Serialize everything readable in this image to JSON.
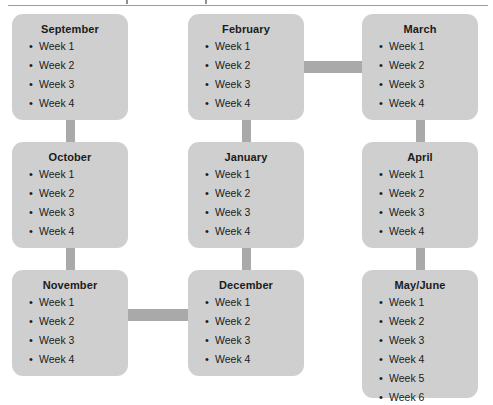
{
  "document": {
    "title_fragment_visible": "",
    "top_rule": true
  },
  "diagram": {
    "type": "month-week-flow",
    "colors": {
      "box_fill": "#cfcfcf",
      "connector": "#a9a9a9",
      "text": "#1b1b1b",
      "rule": "#9b9b9b",
      "background": "#ffffff"
    },
    "boxes": [
      {
        "id": "september",
        "title": "September",
        "weeks": [
          "Week 1",
          "Week 2",
          "Week 3",
          "Week 4"
        ],
        "x": 12,
        "y": 14,
        "w": 116,
        "h": 106
      },
      {
        "id": "february",
        "title": "February",
        "weeks": [
          "Week 1",
          "Week 2",
          "Week 3",
          "Week 4"
        ],
        "x": 188,
        "y": 14,
        "w": 116,
        "h": 106
      },
      {
        "id": "march",
        "title": "March",
        "weeks": [
          "Week 1",
          "Week 2",
          "Week 3",
          "Week 4"
        ],
        "x": 362,
        "y": 14,
        "w": 116,
        "h": 106
      },
      {
        "id": "october",
        "title": "October",
        "weeks": [
          "Week 1",
          "Week 2",
          "Week 3",
          "Week 4"
        ],
        "x": 12,
        "y": 142,
        "w": 116,
        "h": 106
      },
      {
        "id": "january",
        "title": "January",
        "weeks": [
          "Week 1",
          "Week 2",
          "Week 3",
          "Week 4"
        ],
        "x": 188,
        "y": 142,
        "w": 116,
        "h": 106
      },
      {
        "id": "april",
        "title": "April",
        "weeks": [
          "Week 1",
          "Week 2",
          "Week 3",
          "Week 4"
        ],
        "x": 362,
        "y": 142,
        "w": 116,
        "h": 106
      },
      {
        "id": "november",
        "title": "November",
        "weeks": [
          "Week 1",
          "Week 2",
          "Week 3",
          "Week 4"
        ],
        "x": 12,
        "y": 270,
        "w": 116,
        "h": 106
      },
      {
        "id": "december",
        "title": "December",
        "weeks": [
          "Week 1",
          "Week 2",
          "Week 3",
          "Week 4"
        ],
        "x": 188,
        "y": 270,
        "w": 116,
        "h": 106
      },
      {
        "id": "may-june",
        "title": "May/June",
        "weeks": [
          "Week 1",
          "Week 2",
          "Week 3",
          "Week 4",
          "Week 5",
          "Week 6"
        ],
        "x": 362,
        "y": 270,
        "w": 116,
        "h": 128
      }
    ],
    "connectors": [
      {
        "id": "february-to-march",
        "orientation": "h",
        "x": 304,
        "y": 61,
        "w": 58,
        "h": 12
      },
      {
        "id": "september-to-october",
        "orientation": "v",
        "x": 66,
        "y": 116,
        "w": 9,
        "h": 30
      },
      {
        "id": "february-to-january",
        "orientation": "v",
        "x": 242,
        "y": 116,
        "w": 9,
        "h": 30
      },
      {
        "id": "march-to-april",
        "orientation": "v",
        "x": 416,
        "y": 116,
        "w": 9,
        "h": 30
      },
      {
        "id": "october-to-november",
        "orientation": "v",
        "x": 66,
        "y": 244,
        "w": 9,
        "h": 30
      },
      {
        "id": "january-to-december",
        "orientation": "v",
        "x": 242,
        "y": 244,
        "w": 9,
        "h": 30
      },
      {
        "id": "april-to-mayjune",
        "orientation": "v",
        "x": 416,
        "y": 244,
        "w": 9,
        "h": 30
      },
      {
        "id": "november-to-december",
        "orientation": "h",
        "x": 128,
        "y": 309,
        "w": 60,
        "h": 12
      }
    ]
  }
}
